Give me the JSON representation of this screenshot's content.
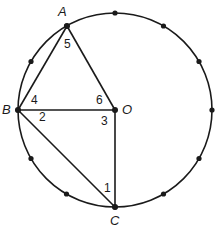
{
  "diagram": {
    "circle": {
      "cx": 115,
      "cy": 110,
      "r": 97,
      "stroke": "#1a1a1a"
    },
    "hour_markers": 12,
    "points": {
      "A": {
        "label": "A",
        "x": 67,
        "y": 26,
        "label_x": 58,
        "label_y": 16
      },
      "B": {
        "label": "B",
        "x": 18,
        "y": 110,
        "label_x": 2,
        "label_y": 114
      },
      "O": {
        "label": "O",
        "x": 115,
        "y": 110,
        "label_x": 122,
        "label_y": 114
      },
      "C": {
        "label": "C",
        "x": 115,
        "y": 207,
        "label_x": 110,
        "label_y": 225
      }
    },
    "segments": [
      "AB",
      "AO",
      "BO",
      "BC",
      "OC"
    ],
    "angle_labels": [
      {
        "label": "1",
        "x": 104,
        "y": 192
      },
      {
        "label": "2",
        "x": 39,
        "y": 121
      },
      {
        "label": "3",
        "x": 101,
        "y": 125
      },
      {
        "label": "4",
        "x": 31,
        "y": 104
      },
      {
        "label": "5",
        "x": 64,
        "y": 48
      },
      {
        "label": "6",
        "x": 96,
        "y": 104
      }
    ]
  }
}
